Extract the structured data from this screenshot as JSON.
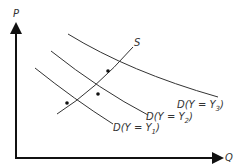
{
  "diagram": {
    "title": "",
    "axes": {
      "y_label": "P",
      "x_label": "Q"
    },
    "curves": {
      "supply_label": "S",
      "demand": [
        {
          "label": "D(Y = Y",
          "sub": "3",
          "close": ")"
        },
        {
          "label": "D(Y = Y",
          "sub": "2",
          "close": ")"
        },
        {
          "label": "D(Y = Y",
          "sub": "1",
          "close": ")"
        }
      ]
    },
    "points": 3,
    "colors": {
      "line": "#333333",
      "axis": "#111111",
      "background": "#ffffff"
    }
  }
}
